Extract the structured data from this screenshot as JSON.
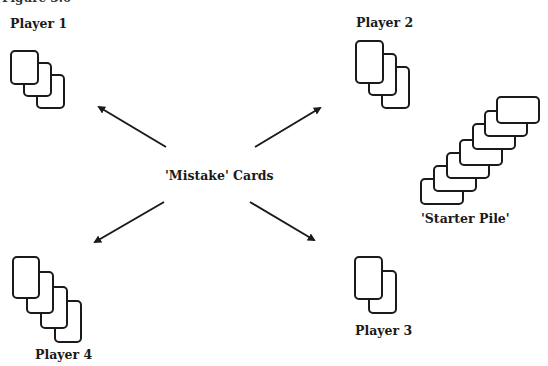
{
  "figure": {
    "caption": "Figure 3.6",
    "center_label": "'Mistake' Cards",
    "starter_pile_label": "'Starter Pile'",
    "players": [
      {
        "label": "Player 1",
        "card_count": 3
      },
      {
        "label": "Player 2",
        "card_count": 3
      },
      {
        "label": "Player 3",
        "card_count": 2
      },
      {
        "label": "Player 4",
        "card_count": 4
      }
    ],
    "starter_pile_card_count": 7,
    "arrows": [
      {
        "from": "'Mistake' Cards",
        "to": "Player 1"
      },
      {
        "from": "'Mistake' Cards",
        "to": "Player 2"
      },
      {
        "from": "'Mistake' Cards",
        "to": "Player 3"
      },
      {
        "from": "'Mistake' Cards",
        "to": "Player 4"
      }
    ]
  }
}
